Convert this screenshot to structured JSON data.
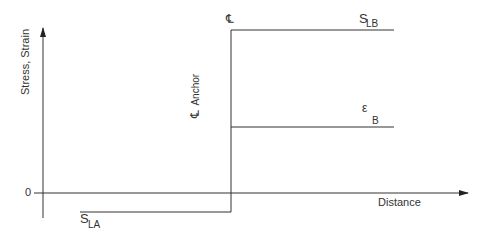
{
  "diagram": {
    "y_axis_label": "Stress, Strain",
    "x_axis_label": "Distance",
    "zero_label": "0",
    "centerline_top_symbol": "℄",
    "anchor_centerline_label": "Anchor",
    "anchor_centerline_symbol": "℄",
    "stress_b": {
      "symbol": "S",
      "subscript": "LB"
    },
    "strain_b": {
      "symbol": "ε",
      "subscript": "B"
    },
    "stress_a": {
      "symbol": "S",
      "subscript": "LA"
    },
    "line_color": "#333333"
  }
}
